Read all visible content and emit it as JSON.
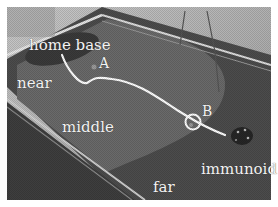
{
  "figure": {
    "labels": {
      "home_base": "home base",
      "point_a": "A",
      "point_b": "B",
      "near": "near",
      "middle": "middle",
      "far": "far",
      "robot": "immunoid"
    },
    "zones": [
      "near",
      "middle",
      "far"
    ],
    "colors": {
      "label_text": "#f2f2f2",
      "path": "#ffffff",
      "floor_near": "#5a5a5a",
      "floor_middle": "#6e6e6e",
      "floor_far": "#4a4a4a",
      "wall": "#b8b8b8"
    }
  }
}
